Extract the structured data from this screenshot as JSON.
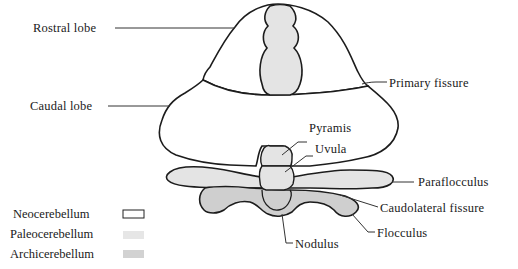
{
  "figure": {
    "type": "anatomical-diagram",
    "labels": {
      "rostral_lobe": "Rostral lobe",
      "caudal_lobe": "Caudal lobe",
      "primary_fissure": "Primary fissure",
      "pyramis": "Pyramis",
      "uvula": "Uvula",
      "paraflocculus": "Paraflocculus",
      "caudolateral_fissure": "Caudolateral fissure",
      "flocculus": "Flocculus",
      "nodulus": "Nodulus"
    },
    "legend": [
      {
        "label": "Neocerebellum",
        "fill": "#ffffff",
        "stroke": "#222222"
      },
      {
        "label": "Paleocerebellum",
        "fill": "#e6e6e6",
        "stroke": "none"
      },
      {
        "label": "Archicerebellum",
        "fill": "#d2d2d2",
        "stroke": "none"
      }
    ],
    "colors": {
      "outline": "#1c1c1c",
      "neo": "#ffffff",
      "paleo": "#e4e4e4",
      "archi": "#cfcfcf",
      "leader": "#333333"
    }
  }
}
